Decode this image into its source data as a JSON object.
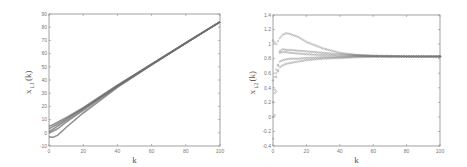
{
  "chart_data": [
    {
      "type": "line",
      "title": "",
      "xlabel": "k",
      "ylabel": "x_{i,1}(k)",
      "xlim": [
        0,
        100
      ],
      "ylim": [
        -10,
        90
      ],
      "xticks": [
        0,
        20,
        40,
        60,
        80,
        100
      ],
      "yticks": [
        -10,
        0,
        10,
        20,
        30,
        40,
        50,
        60,
        70,
        80,
        90
      ],
      "grid": false,
      "legend": null,
      "x": [
        0,
        2,
        5,
        10,
        20,
        40,
        60,
        80,
        100
      ],
      "series": [
        {
          "name": "agent 1",
          "values": [
            5,
            6,
            8,
            11.5,
            19,
            36,
            52,
            68,
            84
          ]
        },
        {
          "name": "agent 2",
          "values": [
            3,
            4.5,
            6.5,
            10.5,
            18.5,
            35.5,
            52,
            68,
            84
          ]
        },
        {
          "name": "agent 3",
          "values": [
            1,
            2.5,
            5,
            9.5,
            18,
            35.5,
            52,
            68,
            84
          ]
        },
        {
          "name": "agent 4",
          "values": [
            0,
            1,
            3,
            8,
            17,
            35,
            51.5,
            68,
            84
          ]
        },
        {
          "name": "agent 5",
          "values": [
            -3,
            -3.5,
            -2,
            4,
            15,
            34.5,
            51.5,
            68,
            84
          ]
        }
      ]
    },
    {
      "type": "scatter",
      "title": "",
      "xlabel": "k",
      "ylabel": "x_{i,2}(k)",
      "xlim": [
        0,
        100
      ],
      "ylim": [
        -0.4,
        1.4
      ],
      "xticks": [
        0,
        20,
        40,
        60,
        80,
        100
      ],
      "yticks": [
        -0.4,
        -0.2,
        0,
        0.2,
        0.4,
        0.6,
        0.8,
        1,
        1.2,
        1.4
      ],
      "ytick_labels": [
        "-0.4",
        "-0.2",
        "0",
        "0.2",
        "0.4",
        "0.6",
        "0.8",
        "1",
        "1.2",
        "1.4"
      ],
      "grid": false,
      "legend": null,
      "marker": "o",
      "x": [
        0,
        2,
        4,
        6,
        8,
        10,
        15,
        20,
        30,
        40,
        50,
        60,
        80,
        100
      ],
      "series": [
        {
          "name": "agent 1",
          "values": [
            1.05,
            1.0,
            1.08,
            1.13,
            1.15,
            1.14,
            1.1,
            1.03,
            0.94,
            0.88,
            0.85,
            0.84,
            0.83,
            0.83
          ]
        },
        {
          "name": "agent 2",
          "values": [
            -0.3,
            0.35,
            0.9,
            0.93,
            0.92,
            0.92,
            0.91,
            0.9,
            0.88,
            0.86,
            0.85,
            0.84,
            0.83,
            0.83
          ]
        },
        {
          "name": "agent 3",
          "values": [
            0.2,
            0.55,
            0.88,
            0.89,
            0.89,
            0.88,
            0.87,
            0.86,
            0.85,
            0.84,
            0.84,
            0.83,
            0.83,
            0.83
          ]
        },
        {
          "name": "agent 4",
          "values": [
            0.0,
            0.65,
            0.76,
            0.78,
            0.79,
            0.8,
            0.8,
            0.81,
            0.82,
            0.82,
            0.83,
            0.83,
            0.83,
            0.83
          ]
        },
        {
          "name": "agent 5",
          "values": [
            0.5,
            0.6,
            0.68,
            0.71,
            0.73,
            0.74,
            0.76,
            0.78,
            0.8,
            0.81,
            0.82,
            0.83,
            0.83,
            0.83
          ]
        }
      ]
    }
  ],
  "labels": {
    "left": {
      "xlabel": "k",
      "ylabel_main": "x",
      "ylabel_sub": "i,1",
      "ylabel_arg": "(k)",
      "xticks": [
        "0",
        "20",
        "40",
        "60",
        "80",
        "100"
      ],
      "yticks": [
        "-10",
        "0",
        "10",
        "20",
        "30",
        "40",
        "50",
        "60",
        "70",
        "80",
        "90"
      ]
    },
    "right": {
      "xlabel": "k",
      "ylabel_main": "x",
      "ylabel_sub": "i,2",
      "ylabel_arg": "(k)",
      "xticks": [
        "0",
        "20",
        "40",
        "60",
        "80",
        "100"
      ],
      "yticks": [
        "-0.4",
        "-0.2",
        "0",
        "0.2",
        "0.4",
        "0.6",
        "0.8",
        "1",
        "1.2",
        "1.4"
      ]
    }
  },
  "colors": {
    "axis": "#8a8a8a",
    "series": "#6f6f6f",
    "text": "#777777"
  }
}
